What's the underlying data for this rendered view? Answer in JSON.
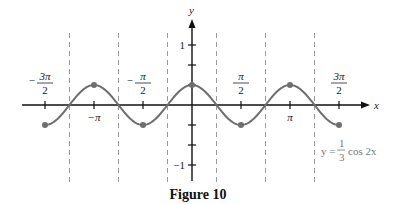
{
  "chart_data": {
    "type": "line",
    "title": "",
    "function": "y = (1/3) cos 2x",
    "xlabel": "x",
    "ylabel": "y",
    "xlim": [
      -4.712,
      4.712
    ],
    "ylim": [
      -1,
      1
    ],
    "x_ticks": [
      {
        "value": -4.712,
        "label_num": "3π",
        "label_den": "2",
        "sign": "−",
        "position": "above"
      },
      {
        "value": -3.1416,
        "label": "−π",
        "position": "below"
      },
      {
        "value": -1.5708,
        "label_num": "π",
        "label_den": "2",
        "sign": "−",
        "position": "above"
      },
      {
        "value": 1.5708,
        "label_num": "π",
        "label_den": "2",
        "sign": "",
        "position": "above"
      },
      {
        "value": 3.1416,
        "label": "π",
        "position": "below"
      },
      {
        "value": 4.712,
        "label_num": "3π",
        "label_den": "2",
        "sign": "",
        "position": "above"
      }
    ],
    "y_ticks": [
      {
        "value": 1,
        "label": "1"
      },
      {
        "value": 0.6667,
        "label": ""
      },
      {
        "value": 0.3333,
        "label": ""
      },
      {
        "value": -0.3333,
        "label": ""
      },
      {
        "value": -0.6667,
        "label": ""
      },
      {
        "value": -1,
        "label": "−1"
      }
    ],
    "asymptote_like_dashed_lines_x": [
      -3.927,
      -2.356,
      -0.785,
      0.785,
      2.356,
      3.927
    ],
    "marked_points": [
      {
        "x": -4.712,
        "y": -0.3333
      },
      {
        "x": -3.1416,
        "y": 0.3333
      },
      {
        "x": -1.5708,
        "y": -0.3333
      },
      {
        "x": 0,
        "y": 0.3333
      },
      {
        "x": 1.5708,
        "y": -0.3333
      },
      {
        "x": 3.1416,
        "y": 0.3333
      },
      {
        "x": 4.712,
        "y": -0.3333
      }
    ],
    "amplitude": 0.3333,
    "period": 3.1416,
    "grid": false,
    "legend": null,
    "annotation": {
      "text_prefix": "y = ",
      "frac_num": "1",
      "frac_den": "3",
      "text_suffix": "cos 2x"
    }
  },
  "caption": "Figure 10",
  "colors": {
    "curve": "#6e6e6e",
    "axis": "#111111",
    "dashed": "#9a9a9a",
    "annotation": "#777777"
  }
}
